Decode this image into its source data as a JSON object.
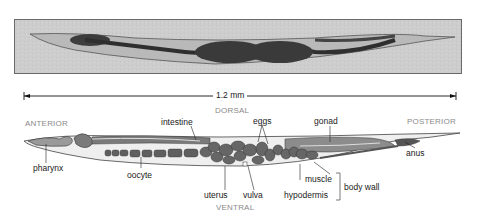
{
  "figure": {
    "photo": {
      "description": "micrograph of C. elegans hermaphrodite"
    },
    "scale_bar": {
      "label": "1.2 mm"
    },
    "orientation": {
      "dorsal": "DORSAL",
      "ventral": "VENTRAL",
      "anterior": "ANTERIOR",
      "posterior": "POSTERIOR"
    },
    "labels": {
      "intestine": "intestine",
      "eggs": "eggs",
      "gonad": "gonad",
      "anus": "anus",
      "pharynx": "pharynx",
      "oocyte": "oocyte",
      "uterus": "uterus",
      "vulva": "vulva",
      "muscle": "muscle",
      "hypodermis": "hypodermis",
      "body_wall": "body wall"
    },
    "colors": {
      "organ_dark": "#5a5a5a",
      "organ_mid": "#8c8c8c",
      "body_fill": "#e8e8e8",
      "label_grey": "#8a8a8a"
    }
  }
}
